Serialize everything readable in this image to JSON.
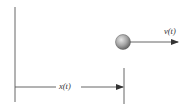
{
  "diagram": {
    "labels": {
      "position": "x(t)",
      "velocity": "v(t)"
    },
    "colors": {
      "line": "#555555",
      "ball_light": "#e0e0e0",
      "ball_dark": "#6a6a6a",
      "text": "#333333"
    }
  }
}
